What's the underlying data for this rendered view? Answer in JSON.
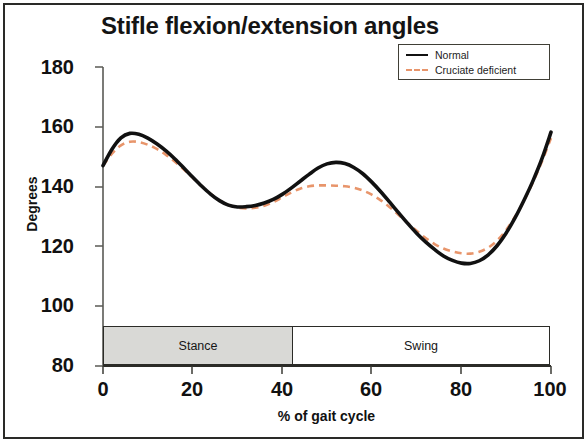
{
  "chart_data": {
    "type": "line",
    "title": "Stifle flexion/extension angles",
    "xlabel": "% of gait cycle",
    "ylabel": "Degrees",
    "xlim": [
      0,
      100
    ],
    "ylim": [
      80,
      180
    ],
    "xticks": [
      0,
      20,
      40,
      60,
      80,
      100
    ],
    "yticks": [
      80,
      100,
      120,
      140,
      160,
      180
    ],
    "grid": false,
    "legend_position": "top-right",
    "series": [
      {
        "name": "Normal",
        "style": "solid",
        "color": "#111111",
        "x": [
          0,
          2,
          4,
          6,
          8,
          10,
          12,
          14,
          16,
          18,
          20,
          22,
          24,
          26,
          28,
          30,
          32,
          34,
          36,
          38,
          40,
          42,
          44,
          46,
          48,
          50,
          52,
          54,
          56,
          58,
          60,
          62,
          64,
          66,
          68,
          70,
          72,
          74,
          76,
          78,
          80,
          82,
          84,
          86,
          88,
          90,
          92,
          94,
          96,
          98,
          100
        ],
        "values": [
          147,
          152.5,
          156.3,
          157.8,
          157.5,
          156.2,
          154.3,
          152.0,
          149.3,
          146.3,
          143.2,
          140.2,
          137.5,
          135.3,
          133.8,
          133.2,
          133.3,
          133.7,
          134.5,
          135.7,
          137.4,
          139.5,
          141.8,
          144.1,
          146.2,
          147.6,
          148.1,
          147.7,
          146.4,
          144.3,
          141.5,
          138.3,
          134.8,
          131.2,
          127.7,
          124.4,
          121.5,
          119.0,
          116.8,
          115.3,
          114.4,
          114.3,
          115.2,
          117.2,
          120.3,
          124.5,
          129.6,
          135.5,
          142.0,
          149.4,
          158.2
        ]
      },
      {
        "name": "Cruciate deficient",
        "style": "dashed",
        "color": "#e8956b",
        "x": [
          0,
          2,
          4,
          6,
          8,
          10,
          12,
          14,
          16,
          18,
          20,
          22,
          24,
          26,
          28,
          30,
          32,
          34,
          36,
          38,
          40,
          42,
          44,
          46,
          48,
          50,
          52,
          54,
          56,
          58,
          60,
          62,
          64,
          66,
          68,
          70,
          72,
          74,
          76,
          78,
          80,
          82,
          84,
          86,
          88,
          90,
          92,
          94,
          96,
          98,
          100
        ],
        "values": [
          147,
          151.0,
          153.8,
          155.0,
          154.9,
          154.0,
          152.6,
          150.7,
          148.4,
          145.8,
          143.0,
          140.2,
          137.6,
          135.4,
          133.9,
          133.0,
          132.7,
          132.9,
          133.6,
          134.8,
          136.4,
          138.0,
          139.3,
          140.1,
          140.4,
          140.4,
          140.3,
          140.1,
          139.6,
          138.7,
          137.3,
          135.4,
          133.1,
          130.5,
          127.8,
          125.2,
          122.8,
          120.8,
          119.3,
          118.3,
          117.7,
          117.6,
          118.2,
          119.6,
          122.0,
          125.5,
          130.0,
          135.4,
          141.6,
          148.5,
          156.2
        ]
      }
    ],
    "phase_bar": {
      "stance_label": "Stance",
      "swing_label": "Swing",
      "stance_end_percent": 42.5,
      "stance_fill": "#d9d9d6",
      "swing_fill": "#ffffff"
    }
  },
  "legend": {
    "items": [
      {
        "label": "Normal"
      },
      {
        "label": "Cruciate deficient"
      }
    ]
  }
}
